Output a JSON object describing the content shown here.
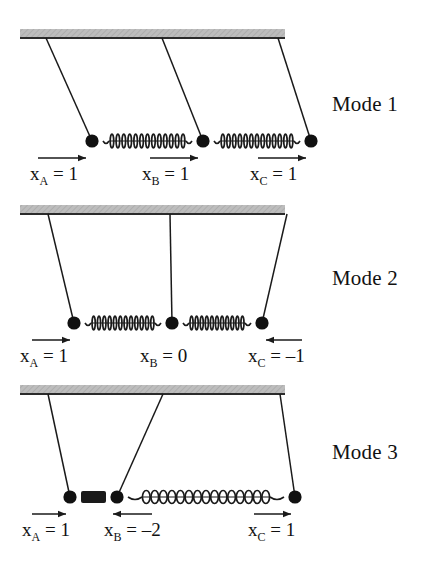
{
  "figure": {
    "colors": {
      "ink": "#1a1a1a",
      "ceiling_fill": "#b9b9b9",
      "ceiling_edge": "#2b2b2b",
      "bob": "#111111",
      "spring": "#1a1a1a",
      "background": "#ffffff"
    }
  },
  "modes": [
    {
      "id": "mode-1",
      "label": "Mode 1",
      "label_x": 332,
      "label_y": 92,
      "ceiling": {
        "x": 20,
        "y": 29,
        "width": 265,
        "height": 9
      },
      "pivots": [
        46,
        162,
        278
      ],
      "bobs": [
        {
          "name": "A",
          "x": 92,
          "y": 141
        },
        {
          "name": "B",
          "x": 203,
          "y": 141
        },
        {
          "name": "C",
          "x": 311,
          "y": 141
        }
      ],
      "springs": [
        {
          "from": 92,
          "to": 203,
          "y": 141,
          "state": "normal",
          "coils": 13
        },
        {
          "from": 203,
          "to": 311,
          "y": 141,
          "state": "normal",
          "coils": 13
        }
      ],
      "arrows": [
        {
          "for": "A",
          "x1": 38,
          "x2": 86,
          "y": 158,
          "dir": "right"
        },
        {
          "for": "B",
          "x1": 150,
          "x2": 198,
          "y": 158,
          "dir": "right"
        },
        {
          "for": "C",
          "x1": 258,
          "x2": 306,
          "y": 158,
          "dir": "right"
        }
      ],
      "equations": [
        {
          "symbol": "x",
          "sub": "A",
          "text": " = 1",
          "x": 30,
          "y": 163
        },
        {
          "symbol": "x",
          "sub": "B",
          "text": " = 1",
          "x": 142,
          "y": 163
        },
        {
          "symbol": "x",
          "sub": "C",
          "text": " = 1",
          "x": 250,
          "y": 163
        }
      ]
    },
    {
      "id": "mode-2",
      "label": "Mode 2",
      "label_x": 332,
      "label_y": 266,
      "ceiling": {
        "x": 20,
        "y": 205,
        "width": 265,
        "height": 9
      },
      "pivots": [
        48,
        170,
        287
      ],
      "bobs": [
        {
          "name": "A",
          "x": 74,
          "y": 323
        },
        {
          "name": "B",
          "x": 172,
          "y": 323
        },
        {
          "name": "C",
          "x": 262,
          "y": 323
        }
      ],
      "springs": [
        {
          "from": 74,
          "to": 172,
          "y": 323,
          "state": "normal",
          "coils": 12
        },
        {
          "from": 172,
          "to": 262,
          "y": 323,
          "state": "normal",
          "coils": 11
        }
      ],
      "arrows": [
        {
          "for": "A",
          "x1": 32,
          "x2": 70,
          "y": 340,
          "dir": "right"
        },
        {
          "for": "C",
          "x1": 302,
          "x2": 266,
          "y": 340,
          "dir": "left"
        }
      ],
      "equations": [
        {
          "symbol": "x",
          "sub": "A",
          "text": " = 1",
          "x": 20,
          "y": 345
        },
        {
          "symbol": "x",
          "sub": "B",
          "text": " = 0",
          "x": 140,
          "y": 345
        },
        {
          "symbol": "x",
          "sub": "C",
          "text": " = –1",
          "x": 248,
          "y": 345
        }
      ]
    },
    {
      "id": "mode-3",
      "label": "Mode 3",
      "label_x": 332,
      "label_y": 440,
      "ceiling": {
        "x": 20,
        "y": 385,
        "width": 265,
        "height": 9
      },
      "pivots": [
        48,
        163,
        280
      ],
      "bobs": [
        {
          "name": "A",
          "x": 70,
          "y": 497
        },
        {
          "name": "B",
          "x": 117,
          "y": 497
        },
        {
          "name": "C",
          "x": 295,
          "y": 497
        }
      ],
      "springs": [
        {
          "from": 70,
          "to": 117,
          "y": 497,
          "state": "compressed",
          "coils": 0
        },
        {
          "from": 117,
          "to": 295,
          "y": 497,
          "state": "stretched",
          "coils": 15
        }
      ],
      "arrows": [
        {
          "for": "A",
          "x1": 32,
          "x2": 66,
          "y": 514,
          "dir": "right"
        },
        {
          "for": "B",
          "x1": 152,
          "x2": 113,
          "y": 514,
          "dir": "left"
        },
        {
          "for": "C",
          "x1": 254,
          "x2": 291,
          "y": 514,
          "dir": "right"
        }
      ],
      "equations": [
        {
          "symbol": "x",
          "sub": "A",
          "text": " = 1",
          "x": 22,
          "y": 519
        },
        {
          "symbol": "x",
          "sub": "B",
          "text": " = –2",
          "x": 104,
          "y": 519
        },
        {
          "symbol": "x",
          "sub": "C",
          "text": " = 1",
          "x": 248,
          "y": 519
        }
      ]
    }
  ]
}
